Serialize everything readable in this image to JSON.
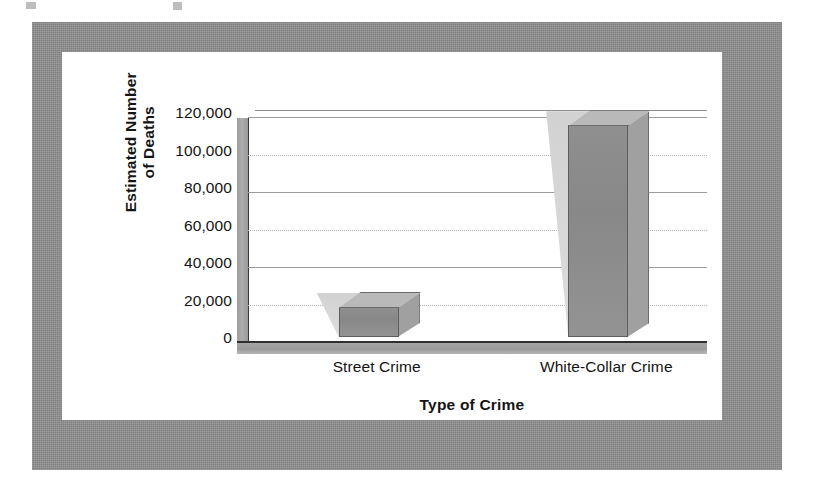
{
  "chart_data": {
    "type": "bar",
    "title": "",
    "categories": [
      "Street Crime",
      "White-Collar Crime"
    ],
    "values": [
      16000,
      113000
    ],
    "xlabel": "Type of Crime",
    "ylabel": "Estimated Number\nof Deaths",
    "ylim": [
      0,
      120000
    ],
    "ytick_labels": [
      "120,000",
      "100,000",
      "80,000",
      "60,000",
      "40,000",
      "20,000",
      "0"
    ],
    "ytick_values": [
      120000,
      100000,
      80000,
      60000,
      40000,
      20000,
      0
    ],
    "grid": true,
    "legend": false,
    "style_3d": true,
    "colors": {
      "bar_front": "#8c8c8c",
      "bar_top": "#b9b9b9",
      "bar_side": "#a0a0a0",
      "bar_shadow": "#d6d6d6",
      "floor": "#a0a0a0",
      "gridline": "#9b9b9b",
      "frame": "#8d8d8d",
      "panel": "#ffffff",
      "text": "#141414"
    }
  },
  "figure": {
    "frame_label": "figure-border",
    "panel_label": "chart-panel"
  }
}
